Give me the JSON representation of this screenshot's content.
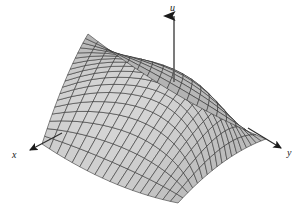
{
  "figure": {
    "title": "",
    "caption": "",
    "background_color": "#ffffff",
    "axis_color": "#1a1a1a"
  },
  "axes": {
    "vertical": {
      "name": "u-axis",
      "label": "u",
      "direction": "up",
      "arrow": true
    },
    "left": {
      "name": "x-axis",
      "label": "x",
      "direction": "down-left",
      "arrow": true
    },
    "right": {
      "name": "y-axis",
      "label": "y",
      "direction": "down-right",
      "arrow": true
    }
  },
  "chart_data": {
    "type": "surface",
    "title": "",
    "subtitle": "",
    "xlabel": "x",
    "ylabel": "y",
    "zlabel": "u",
    "surface_kind": "hyperbolic paraboloid (saddle)",
    "equation": "u = x^2 - y^2",
    "grid": true,
    "legend": "none",
    "projection": "oblique-3d",
    "shading": "grayscale",
    "mesh": {
      "u_divisions": 18,
      "v_divisions": 18,
      "line_color": "#2b2b2b",
      "fill_light": "#d6d6d6",
      "fill_dark": "#8a8a8a"
    },
    "xlim": [
      -1,
      1
    ],
    "ylim": [
      -1,
      1
    ],
    "zlim": [
      -1,
      1
    ],
    "corners": {
      "left_peak_label": "x-axis corner (raised)",
      "right_peak_label": "y-axis corner (raised)",
      "front_valley_label": "front corner (lowered)",
      "back_valley_label": "back corner (lowered)"
    },
    "saddle_point": {
      "x": 0,
      "y": 0,
      "u": 0
    }
  }
}
